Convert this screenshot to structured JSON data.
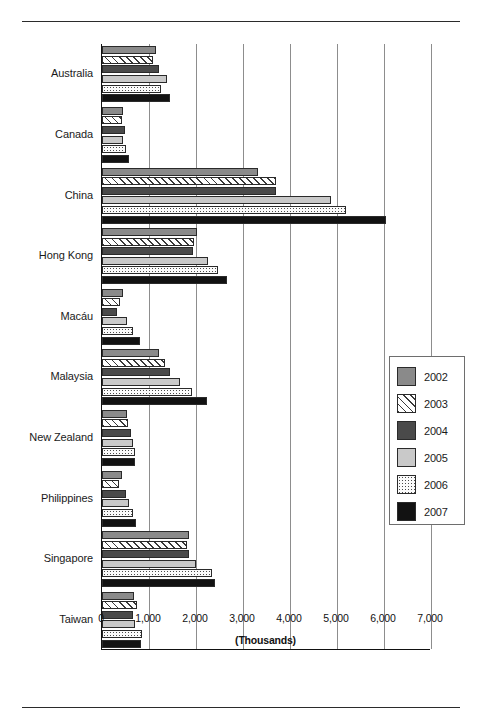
{
  "chart_data": {
    "type": "bar",
    "orientation": "horizontal",
    "title": "",
    "xlabel": "(Thousands)",
    "ylabel": "",
    "xlim": [
      0,
      7000
    ],
    "xticks": [
      0,
      1000,
      2000,
      3000,
      4000,
      5000,
      6000,
      7000
    ],
    "xtick_labels": [
      "0",
      "1,000",
      "2,000",
      "3,000",
      "4,000",
      "5,000",
      "6,000",
      "7,000"
    ],
    "grid": "vertical",
    "legend_position": "right-middle",
    "categories": [
      "Australia",
      "Canada",
      "China",
      "Hong Kong",
      "Macáu",
      "Malaysia",
      "New Zealand",
      "Philippines",
      "Singapore",
      "Taiwan"
    ],
    "series": [
      {
        "name": "2002",
        "color": "#8a8a8a",
        "pattern": "solid-gray",
        "values": [
          1150,
          450,
          3320,
          2020,
          450,
          1210,
          530,
          430,
          1850,
          680
        ]
      },
      {
        "name": "2003",
        "color": "#ffffff",
        "pattern": "diagonal-hatch",
        "values": [
          1090,
          430,
          3700,
          1960,
          380,
          1350,
          550,
          370,
          1810,
          740
        ]
      },
      {
        "name": "2004",
        "color": "#4a4a4a",
        "pattern": "solid-dark-gray",
        "values": [
          1210,
          490,
          3700,
          1940,
          320,
          1450,
          620,
          500,
          1850,
          660
        ]
      },
      {
        "name": "2005",
        "color": "#c9c9c9",
        "pattern": "solid-light-gray",
        "values": [
          1380,
          450,
          4870,
          2260,
          530,
          1660,
          660,
          580,
          2000,
          700
        ]
      },
      {
        "name": "2006",
        "color": "#fbfbfb",
        "pattern": "stipple-dots",
        "values": [
          1260,
          500,
          5190,
          2470,
          660,
          1910,
          700,
          660,
          2340,
          850
        ]
      },
      {
        "name": "2007",
        "color": "#121212",
        "pattern": "solid-black",
        "values": [
          1450,
          580,
          6050,
          2660,
          810,
          2230,
          700,
          720,
          2400,
          830
        ]
      }
    ]
  },
  "legend": {
    "items": [
      {
        "label": "2002"
      },
      {
        "label": "2003"
      },
      {
        "label": "2004"
      },
      {
        "label": "2005"
      },
      {
        "label": "2006"
      },
      {
        "label": "2007"
      }
    ]
  }
}
